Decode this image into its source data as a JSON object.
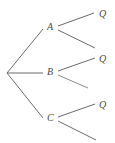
{
  "diagram": {
    "type": "probability-tree",
    "title": "",
    "background_color": "#ffffff",
    "line_color": "#6b6b6b",
    "text_color": "#4a4a4a",
    "root": {
      "label": "",
      "x": 7,
      "y": 73
    },
    "nodes": [
      {
        "id": "A",
        "label": "A",
        "label_x": 47,
        "label_y": 22,
        "node_x": 44,
        "node_y": 28,
        "branch_from_root": {
          "x1": 7,
          "y1": 73,
          "x2": 43,
          "y2": 29
        },
        "children": [
          {
            "id": "A-upper",
            "label": "Q",
            "label_x": 99,
            "label_y": 9,
            "line": {
              "x1": 58,
              "y1": 26,
              "x2": 94,
              "y2": 13
            }
          },
          {
            "id": "A-lower",
            "label": "",
            "label_x": null,
            "label_y": null,
            "line": {
              "x1": 58,
              "y1": 30,
              "x2": 95,
              "y2": 48
            }
          }
        ]
      },
      {
        "id": "B",
        "label": "B",
        "label_x": 47,
        "label_y": 67,
        "node_x": 44,
        "node_y": 73,
        "branch_from_root": {
          "x1": 7,
          "y1": 73,
          "x2": 43,
          "y2": 73
        },
        "children": [
          {
            "id": "B-upper",
            "label": "Q",
            "label_x": 99,
            "label_y": 54,
            "line": {
              "x1": 58,
              "y1": 71,
              "x2": 95,
              "y2": 58
            }
          },
          {
            "id": "B-lower",
            "label": "",
            "label_x": null,
            "label_y": null,
            "line": {
              "x1": 58,
              "y1": 75,
              "x2": 88,
              "y2": 88
            }
          }
        ]
      },
      {
        "id": "C",
        "label": "C",
        "label_x": 47,
        "label_y": 113,
        "node_x": 44,
        "node_y": 119,
        "branch_from_root": {
          "x1": 7,
          "y1": 73,
          "x2": 43,
          "y2": 118
        },
        "children": [
          {
            "id": "C-upper",
            "label": "Q",
            "label_x": 99,
            "label_y": 100,
            "line": {
              "x1": 58,
              "y1": 117,
              "x2": 95,
              "y2": 104
            }
          },
          {
            "id": "C-lower",
            "label": "",
            "label_x": null,
            "label_y": null,
            "line": {
              "x1": 58,
              "y1": 121,
              "x2": 96,
              "y2": 140
            }
          }
        ]
      }
    ]
  }
}
